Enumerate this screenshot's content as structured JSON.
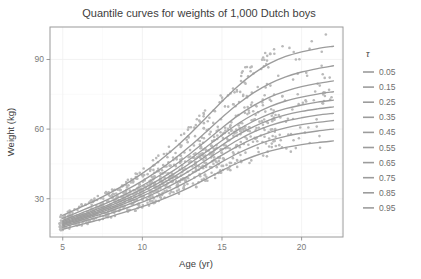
{
  "chart_data": {
    "type": "line",
    "title": "Quantile curves for weights of 1,000 Dutch boys",
    "xlabel": "Age (yr)",
    "ylabel": "Weight (kg)",
    "xlim": [
      4.2,
      22.6
    ],
    "ylim": [
      13.5,
      104.0
    ],
    "xticks": [
      5,
      10,
      15,
      20
    ],
    "xtick_labels": [
      "5",
      "10",
      "15",
      "20"
    ],
    "yticks": [
      30,
      60,
      90
    ],
    "ytick_labels": [
      "30",
      "60",
      "90"
    ],
    "grid": true,
    "legend_position": "right",
    "legend_title": "τ",
    "x": [
      5,
      6,
      7,
      8,
      9,
      10,
      11,
      12,
      13,
      14,
      15,
      16,
      17,
      18,
      19,
      20,
      21,
      22
    ],
    "series": [
      {
        "name": "0.05",
        "tau": 0.05,
        "color": "#9c9c9c",
        "values": [
          16.8,
          18.6,
          20.4,
          22.3,
          24.4,
          26.6,
          29.1,
          31.9,
          35.0,
          38.5,
          42.1,
          45.5,
          48.3,
          50.5,
          52.1,
          53.3,
          54.2,
          54.9
        ]
      },
      {
        "name": "0.15",
        "tau": 0.15,
        "color": "#9c9c9c",
        "values": [
          17.7,
          19.7,
          21.6,
          23.7,
          26.0,
          28.5,
          31.3,
          34.5,
          38.0,
          41.9,
          45.9,
          49.6,
          52.7,
          55.1,
          56.9,
          58.2,
          59.2,
          60.0
        ]
      },
      {
        "name": "0.25",
        "tau": 0.25,
        "color": "#9c9c9c",
        "values": [
          18.3,
          20.4,
          22.5,
          24.7,
          27.2,
          29.9,
          33.0,
          36.5,
          40.3,
          44.5,
          48.8,
          52.7,
          56.0,
          58.6,
          60.5,
          61.9,
          62.9,
          63.7
        ]
      },
      {
        "name": "0.35",
        "tau": 0.35,
        "color": "#9c9c9c",
        "values": [
          18.8,
          21.0,
          23.2,
          25.6,
          28.2,
          31.1,
          34.4,
          38.1,
          42.2,
          46.6,
          51.1,
          55.3,
          58.8,
          61.5,
          63.5,
          64.9,
          66.0,
          66.8
        ]
      },
      {
        "name": "0.45",
        "tau": 0.45,
        "color": "#9c9c9c",
        "values": [
          19.2,
          21.5,
          23.8,
          26.3,
          29.1,
          32.1,
          35.6,
          39.5,
          43.8,
          48.4,
          53.1,
          57.5,
          61.1,
          64.0,
          66.1,
          67.6,
          68.7,
          69.6
        ]
      },
      {
        "name": "0.55",
        "tau": 0.55,
        "color": "#9c9c9c",
        "values": [
          19.6,
          22.0,
          24.4,
          27.0,
          29.9,
          33.1,
          36.7,
          40.8,
          45.3,
          50.1,
          55.1,
          59.7,
          63.5,
          66.6,
          68.8,
          70.4,
          71.6,
          72.5
        ]
      },
      {
        "name": "0.65",
        "tau": 0.65,
        "color": "#9c9c9c",
        "values": [
          20.1,
          22.6,
          25.1,
          27.8,
          30.9,
          34.2,
          38.0,
          42.3,
          47.1,
          52.2,
          57.4,
          62.3,
          66.4,
          69.7,
          72.1,
          73.8,
          75.1,
          76.1
        ]
      },
      {
        "name": "0.75",
        "tau": 0.75,
        "color": "#9c9c9c",
        "values": [
          20.7,
          23.3,
          26.0,
          28.9,
          32.1,
          35.7,
          39.7,
          44.3,
          49.4,
          54.9,
          60.5,
          65.8,
          70.2,
          73.8,
          76.4,
          78.3,
          79.7,
          80.8
        ]
      },
      {
        "name": "0.85",
        "tau": 0.85,
        "color": "#9c9c9c",
        "values": [
          21.5,
          24.3,
          27.2,
          30.3,
          33.8,
          37.7,
          42.1,
          47.1,
          52.7,
          58.8,
          65.0,
          70.8,
          75.7,
          79.6,
          82.5,
          84.6,
          86.1,
          87.3
        ]
      },
      {
        "name": "0.95",
        "tau": 0.95,
        "color": "#9c9c9c",
        "values": [
          22.8,
          25.9,
          29.1,
          32.6,
          36.5,
          40.9,
          45.9,
          51.6,
          58.0,
          64.9,
          71.9,
          78.5,
          84.0,
          88.3,
          91.3,
          93.3,
          94.7,
          95.7
        ]
      }
    ],
    "scatter": {
      "label": "Dutch boys weight observations",
      "n": 1000,
      "color": "#b9b9b9",
      "marker": "circle",
      "size": 1.3
    }
  },
  "legend": {
    "title": "τ",
    "entries": [
      {
        "label": "0.05"
      },
      {
        "label": "0.15"
      },
      {
        "label": "0.25"
      },
      {
        "label": "0.35"
      },
      {
        "label": "0.45"
      },
      {
        "label": "0.55"
      },
      {
        "label": "0.65"
      },
      {
        "label": "0.75"
      },
      {
        "label": "0.85"
      },
      {
        "label": "0.95"
      }
    ]
  },
  "colors": {
    "curve": "#9c9c9c",
    "point": "#b9b9b9",
    "panel_border": "#9a9a9a",
    "grid_major": "#f0f0f0",
    "grid_minor": "#f7f7f7",
    "text": "#3d3d3d",
    "tick_text": "#7a7a7a",
    "background": "#ffffff"
  }
}
